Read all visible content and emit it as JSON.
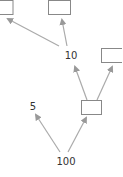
{
  "diagram": {
    "type": "tree",
    "colors": {
      "edge": "#aaaaaa",
      "box_border": "#888888",
      "text": "#333333",
      "background": "#ffffff"
    },
    "nodes": [
      {
        "id": "root",
        "label": "100",
        "kind": "value"
      },
      {
        "id": "left",
        "label": "5",
        "kind": "value"
      },
      {
        "id": "right",
        "label": "",
        "kind": "empty-box"
      },
      {
        "id": "mid",
        "label": "10",
        "kind": "value"
      },
      {
        "id": "right-right",
        "label": "",
        "kind": "empty-box"
      },
      {
        "id": "mid-left",
        "label": "",
        "kind": "empty-box"
      },
      {
        "id": "mid-right",
        "label": "",
        "kind": "empty-box"
      }
    ],
    "edges": [
      {
        "from": "root",
        "to": "left"
      },
      {
        "from": "root",
        "to": "right"
      },
      {
        "from": "right",
        "to": "mid"
      },
      {
        "from": "right",
        "to": "right-right"
      },
      {
        "from": "mid",
        "to": "mid-left"
      },
      {
        "from": "mid",
        "to": "mid-right"
      }
    ]
  }
}
